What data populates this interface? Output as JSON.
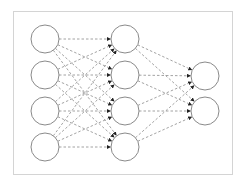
{
  "diagram": {
    "type": "feedforward-neural-network",
    "colors": {
      "frame": "#d4d4d4",
      "node_stroke": "#8a8a8a",
      "node_fill": "#ffffff",
      "edge": "#8c8c8c",
      "arrowhead": "#222222"
    },
    "frame": {
      "x": 13,
      "y": 11,
      "width": 219,
      "height": 163
    },
    "node_radius": 14,
    "layers": [
      {
        "name": "input",
        "x": 45,
        "nodes": [
          39,
          75,
          111,
          147
        ]
      },
      {
        "name": "hidden",
        "x": 125,
        "nodes": [
          39,
          75,
          111,
          147
        ]
      },
      {
        "name": "output",
        "x": 205,
        "nodes": [
          76,
          111
        ]
      }
    ],
    "connections": "fully-connected",
    "edge_style": "dashed-arrow"
  }
}
